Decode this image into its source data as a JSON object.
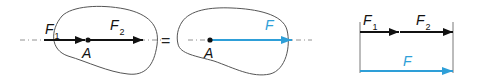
{
  "colors": {
    "outline": "#555555",
    "force_black": "#111111",
    "resultant_blue": "#2e9fd8",
    "axis_dash": "#777777"
  },
  "left_diagram": {
    "force1": {
      "symbol": "F",
      "subscript": "1"
    },
    "force2": {
      "symbol": "F",
      "subscript": "2"
    },
    "point": "A"
  },
  "equals_sign": "=",
  "middle_diagram": {
    "resultant": {
      "symbol": "F"
    },
    "point": "A"
  },
  "right_diagram": {
    "force1": {
      "symbol": "F",
      "subscript": "1"
    },
    "force2": {
      "symbol": "F",
      "subscript": "2"
    },
    "resultant": {
      "symbol": "F"
    }
  }
}
